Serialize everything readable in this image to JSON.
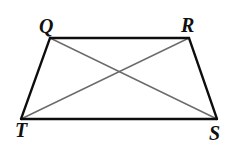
{
  "figure": {
    "name": "Trapezoid QRST with diagonals",
    "background_color": "#ffffff",
    "width": 240,
    "height": 150,
    "vertices": [
      {
        "id": "Q",
        "label": "Q",
        "x": 50,
        "y": 38,
        "label_x": 45,
        "label_y": 26
      },
      {
        "id": "R",
        "label": "R",
        "x": 189,
        "y": 38,
        "label_x": 187,
        "label_y": 25
      },
      {
        "id": "S",
        "label": "S",
        "x": 217,
        "y": 119,
        "label_x": 215,
        "label_y": 133
      },
      {
        "id": "T",
        "label": "T",
        "x": 21,
        "y": 119,
        "label_x": 21,
        "label_y": 130
      }
    ],
    "sides": [
      {
        "id": "QR",
        "from": "Q",
        "to": "R",
        "color": "#0d0d0d",
        "width": 2.3,
        "style": "solid"
      },
      {
        "id": "RS",
        "from": "R",
        "to": "S",
        "color": "#0d0d0d",
        "width": 2.3,
        "style": "solid"
      },
      {
        "id": "TS",
        "from": "T",
        "to": "S",
        "color": "#0d0d0d",
        "width": 2.3,
        "style": "solid"
      },
      {
        "id": "QT",
        "from": "Q",
        "to": "T",
        "color": "#0d0d0d",
        "width": 2.3,
        "style": "solid"
      }
    ],
    "diagonals": [
      {
        "id": "QS",
        "from": "Q",
        "to": "S",
        "color": "#6b6b6b",
        "width": 1.4,
        "style": "solid"
      },
      {
        "id": "RT",
        "from": "R",
        "to": "T",
        "color": "#6b6b6b",
        "width": 1.4,
        "style": "solid"
      }
    ],
    "intersection": {
      "id": "diagonal-intersection",
      "x": 117,
      "y": 68,
      "marked": false
    },
    "shape_type": "trapezoid",
    "label_font_style": "bold italic serif",
    "label_font_size": 20
  },
  "chart_data": {
    "type": "diagram",
    "title": "",
    "shape": "trapezoid",
    "points": {
      "Q": [
        50,
        38
      ],
      "R": [
        189,
        38
      ],
      "S": [
        217,
        119
      ],
      "T": [
        21,
        119
      ]
    },
    "edges": [
      [
        "Q",
        "R"
      ],
      [
        "R",
        "S"
      ],
      [
        "S",
        "T"
      ],
      [
        "T",
        "Q"
      ]
    ],
    "diagonals": [
      [
        "Q",
        "S"
      ],
      [
        "R",
        "T"
      ]
    ],
    "labels": [
      "Q",
      "R",
      "S",
      "T"
    ],
    "xlabel": "",
    "ylabel": "",
    "grid": false,
    "legend": null
  }
}
